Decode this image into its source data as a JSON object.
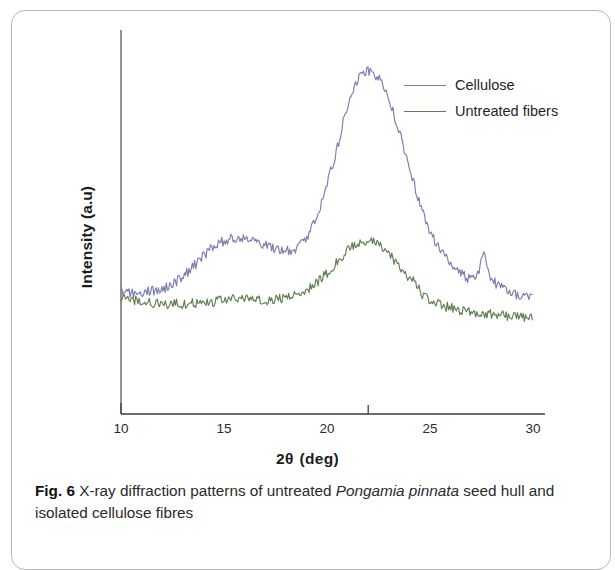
{
  "figure": {
    "label": "Fig. 6",
    "caption_part1": "X-ray diffraction patterns of untreated",
    "caption_species": "Pongamia pinnata",
    "caption_part2": "seed hull and isolated cellulose fibres"
  },
  "axes": {
    "x_title_symbol": "2θ",
    "x_title_unit": "(deg)",
    "y_title": "Intensity (a.u)"
  },
  "legend": {
    "items": [
      {
        "label": "Cellulose",
        "color": "#7b7cb0"
      },
      {
        "label": "Untreated fibers",
        "color": "#5f7f50"
      }
    ]
  },
  "chart_data": {
    "type": "line",
    "title": "X-ray diffraction patterns of untreated Pongamia pinnata seed hull and isolated cellulose fibres",
    "xlabel": "2θ (deg)",
    "ylabel": "Intensity (a.u)",
    "xlim": [
      10,
      30
    ],
    "ylim": [
      0,
      100
    ],
    "xticks": [
      10,
      15,
      20,
      25,
      30
    ],
    "yticks": [],
    "grid": false,
    "legend_position": "upper right",
    "noise_amplitude": 1.6,
    "annotations": [
      {
        "text": "cellulose I (200) main peak",
        "x": 22.0,
        "y": 96
      },
      {
        "text": "cellulose (110) shoulder",
        "x": 16.0,
        "y": 42
      },
      {
        "text": "sharp minor reflection",
        "x": 27.6,
        "y": 33
      },
      {
        "text": "amorphous hull broad peak",
        "x": 22.2,
        "y": 42
      }
    ],
    "series": [
      {
        "name": "Cellulose",
        "color": "#7b7cb0",
        "x": [
          10.0,
          10.5,
          11.0,
          11.5,
          12.0,
          12.5,
          13.0,
          13.5,
          14.0,
          14.5,
          15.0,
          15.5,
          16.0,
          16.5,
          17.0,
          17.5,
          18.0,
          18.5,
          19.0,
          19.5,
          20.0,
          20.5,
          21.0,
          21.5,
          22.0,
          22.3,
          22.6,
          23.0,
          23.5,
          24.0,
          24.5,
          25.0,
          25.5,
          26.0,
          26.5,
          27.0,
          27.3,
          27.6,
          27.9,
          28.2,
          28.5,
          29.0,
          29.5,
          30.0
        ],
        "y": [
          25.5,
          25.0,
          25.2,
          25.8,
          26.5,
          28.0,
          30.5,
          33.5,
          37.0,
          40.0,
          41.8,
          42.5,
          42.8,
          42.0,
          40.5,
          39.0,
          38.5,
          39.5,
          43.0,
          50.0,
          60.0,
          72.0,
          85.0,
          94.0,
          96.5,
          95.0,
          93.0,
          87.0,
          77.0,
          65.0,
          54.0,
          45.0,
          39.0,
          34.5,
          31.5,
          29.5,
          31.0,
          37.5,
          31.0,
          28.0,
          26.5,
          25.0,
          23.8,
          23.0
        ]
      },
      {
        "name": "Untreated fibers",
        "color": "#5f7f50",
        "x": [
          10.0,
          10.5,
          11.0,
          11.5,
          12.0,
          12.5,
          13.0,
          13.5,
          14.0,
          14.5,
          15.0,
          15.5,
          16.0,
          16.5,
          17.0,
          17.5,
          18.0,
          18.5,
          19.0,
          19.5,
          20.0,
          20.5,
          21.0,
          21.5,
          22.0,
          22.3,
          22.6,
          23.0,
          23.5,
          24.0,
          24.4,
          24.7,
          25.0,
          25.5,
          26.0,
          26.5,
          27.0,
          27.5,
          28.0,
          28.5,
          29.0,
          29.5,
          30.0
        ],
        "y": [
          24.0,
          22.8,
          22.2,
          21.8,
          21.5,
          21.5,
          21.6,
          21.8,
          22.0,
          22.3,
          22.6,
          23.0,
          23.4,
          23.0,
          22.8,
          23.0,
          23.6,
          24.6,
          26.2,
          28.5,
          31.5,
          35.0,
          38.5,
          41.0,
          41.8,
          41.2,
          40.0,
          37.5,
          33.5,
          30.0,
          27.5,
          24.0,
          22.5,
          21.2,
          20.3,
          19.6,
          19.0,
          18.6,
          18.2,
          17.9,
          17.6,
          17.3,
          17.0
        ]
      }
    ]
  }
}
